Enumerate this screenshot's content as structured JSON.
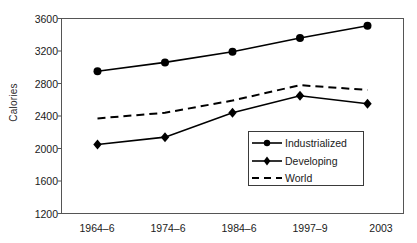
{
  "chart_data": {
    "type": "line",
    "title": "",
    "xlabel": "",
    "ylabel": "Calories",
    "categories": [
      "1964–6",
      "1974–6",
      "1984–6",
      "1997–9",
      "2003"
    ],
    "ylim": [
      1200,
      3600
    ],
    "yticks": [
      1200,
      1600,
      2000,
      2400,
      2800,
      3200,
      3600
    ],
    "grid": false,
    "legend_position": "lower-right-inside",
    "series": [
      {
        "name": "Industrialized",
        "values": [
          2950,
          3060,
          3190,
          3360,
          3510
        ],
        "marker": "circle",
        "line_style": "solid",
        "color": "#000000"
      },
      {
        "name": "Developing",
        "values": [
          2050,
          2140,
          2440,
          2650,
          2550
        ],
        "marker": "diamond",
        "line_style": "solid",
        "color": "#000000"
      },
      {
        "name": "World",
        "values": [
          2370,
          2440,
          2590,
          2780,
          2720
        ],
        "marker": "none",
        "line_style": "dashed",
        "color": "#000000"
      }
    ]
  },
  "axes": {
    "y_title": "Calories",
    "y_tick_labels": [
      "3600",
      "3200",
      "2800",
      "2400",
      "2000",
      "1600",
      "1200"
    ],
    "x_tick_labels": [
      "1964–6",
      "1974–6",
      "1984–6",
      "1997–9",
      "2003"
    ]
  },
  "legend": {
    "entries": [
      {
        "label": "Industrialized"
      },
      {
        "label": "Developing"
      },
      {
        "label": "World"
      }
    ]
  }
}
